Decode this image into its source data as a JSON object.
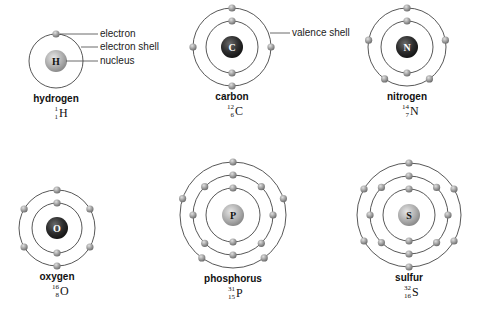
{
  "colors": {
    "shell_line": "#444444",
    "electron": "#9a9a9a",
    "nucleus_light": "#b8b8b8",
    "nucleus_dark": "#2a2a2a",
    "text": "#111111"
  },
  "callouts": {
    "electron": "electron",
    "electron_shell": "electron shell",
    "nucleus": "nucleus",
    "valence_shell": "valence shell"
  },
  "atoms": [
    {
      "name": "hydrogen",
      "symbol": "H",
      "mass_number": "1",
      "atomic_number": "1",
      "shells": [
        1
      ],
      "nucleus_style": "light",
      "cx": 56,
      "cy": 61,
      "radii": [
        27
      ]
    },
    {
      "name": "carbon",
      "symbol": "C",
      "mass_number": "12",
      "atomic_number": "6",
      "shells": [
        2,
        4
      ],
      "nucleus_style": "dark",
      "cx": 232,
      "cy": 47,
      "radii": [
        26,
        39
      ]
    },
    {
      "name": "nitrogen",
      "symbol": "N",
      "mass_number": "14",
      "atomic_number": "7",
      "shells": [
        2,
        5
      ],
      "nucleus_style": "dark",
      "cx": 407,
      "cy": 47,
      "radii": [
        26,
        39
      ]
    },
    {
      "name": "oxygen",
      "symbol": "O",
      "mass_number": "16",
      "atomic_number": "8",
      "shells": [
        2,
        6
      ],
      "nucleus_style": "dark",
      "cx": 57,
      "cy": 228,
      "radii": [
        25,
        38
      ]
    },
    {
      "name": "phosphorus",
      "symbol": "P",
      "mass_number": "31",
      "atomic_number": "15",
      "shells": [
        2,
        8,
        5
      ],
      "nucleus_style": "light",
      "cx": 233,
      "cy": 215,
      "radii": [
        27,
        40,
        53
      ]
    },
    {
      "name": "sulfur",
      "symbol": "S",
      "mass_number": "32",
      "atomic_number": "16",
      "shells": [
        2,
        8,
        6
      ],
      "nucleus_style": "light",
      "cx": 409,
      "cy": 215,
      "radii": [
        26,
        39,
        52
      ]
    }
  ]
}
